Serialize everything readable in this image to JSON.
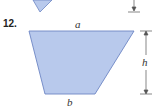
{
  "problem": {
    "number": "12.",
    "labels": {
      "top_base": "a",
      "bottom_base": "b",
      "height": "h"
    }
  },
  "colors": {
    "fill": "#b8c9ec",
    "stroke": "#6d86c4",
    "dimension_line": "#555555"
  }
}
